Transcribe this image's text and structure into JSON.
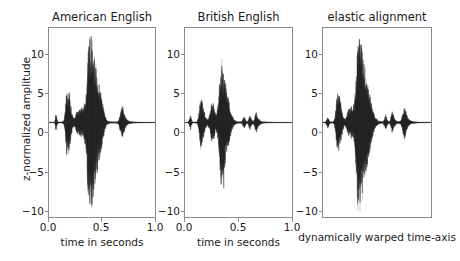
{
  "chart_data": {
    "type": "line",
    "title": "",
    "ylabel": "z-normalized amplitude",
    "ylim": [
      -12.5,
      12.5
    ],
    "yticks": [
      10,
      5,
      0,
      -5,
      -10
    ],
    "ytick_labels": [
      "10",
      "5",
      "0",
      "−5",
      "−10"
    ],
    "grid": false,
    "legend": null,
    "panels": [
      {
        "title": "American English",
        "xlabel": "time in seconds",
        "xlim": [
          0.0,
          1.0
        ],
        "xticks": [
          0.0,
          0.5,
          1.0
        ],
        "xtick_labels": [
          "0.0",
          "0.5",
          "1.0"
        ],
        "series_name": "waveform",
        "description": "speech waveform, z-normalized amplitude vs time in seconds",
        "envelope": [
          [
            0.0,
            0.05
          ],
          [
            0.04,
            0.06
          ],
          [
            0.055,
            0.1
          ],
          [
            0.062,
            0.85
          ],
          [
            0.068,
            1.3
          ],
          [
            0.075,
            0.55
          ],
          [
            0.082,
            0.12
          ],
          [
            0.1,
            0.08
          ],
          [
            0.12,
            0.1
          ],
          [
            0.14,
            0.25
          ],
          [
            0.15,
            1.2
          ],
          [
            0.158,
            2.6
          ],
          [
            0.165,
            4.4
          ],
          [
            0.172,
            4.2
          ],
          [
            0.18,
            3.2
          ],
          [
            0.19,
            4.1
          ],
          [
            0.2,
            3.0
          ],
          [
            0.21,
            2.0
          ],
          [
            0.22,
            1.1
          ],
          [
            0.232,
            0.55
          ],
          [
            0.245,
            0.7
          ],
          [
            0.258,
            1.35
          ],
          [
            0.268,
            1.7
          ],
          [
            0.278,
            1.4
          ],
          [
            0.288,
            1.9
          ],
          [
            0.298,
            1.6
          ],
          [
            0.308,
            2.1
          ],
          [
            0.318,
            1.7
          ],
          [
            0.328,
            2.3
          ],
          [
            0.338,
            2.8
          ],
          [
            0.348,
            3.3
          ],
          [
            0.356,
            5.2
          ],
          [
            0.362,
            7.6
          ],
          [
            0.368,
            9.5
          ],
          [
            0.374,
            10.9
          ],
          [
            0.38,
            9.8
          ],
          [
            0.386,
            11.3
          ],
          [
            0.392,
            10.2
          ],
          [
            0.398,
            11.6
          ],
          [
            0.404,
            10.6
          ],
          [
            0.41,
            11.4
          ],
          [
            0.416,
            10.0
          ],
          [
            0.422,
            9.2
          ],
          [
            0.43,
            8.6
          ],
          [
            0.438,
            8.0
          ],
          [
            0.446,
            7.4
          ],
          [
            0.454,
            6.8
          ],
          [
            0.462,
            6.2
          ],
          [
            0.47,
            5.6
          ],
          [
            0.478,
            5.0
          ],
          [
            0.486,
            4.4
          ],
          [
            0.494,
            3.8
          ],
          [
            0.502,
            3.1
          ],
          [
            0.51,
            2.4
          ],
          [
            0.518,
            1.8
          ],
          [
            0.526,
            1.2
          ],
          [
            0.534,
            0.7
          ],
          [
            0.545,
            0.35
          ],
          [
            0.56,
            0.2
          ],
          [
            0.58,
            0.14
          ],
          [
            0.6,
            0.12
          ],
          [
            0.62,
            0.1
          ],
          [
            0.64,
            0.12
          ],
          [
            0.655,
            0.25
          ],
          [
            0.665,
            0.7
          ],
          [
            0.675,
            1.3
          ],
          [
            0.685,
            1.9
          ],
          [
            0.692,
            2.2
          ],
          [
            0.7,
            1.9
          ],
          [
            0.708,
            1.4
          ],
          [
            0.716,
            0.95
          ],
          [
            0.726,
            0.6
          ],
          [
            0.74,
            0.35
          ],
          [
            0.76,
            0.2
          ],
          [
            0.79,
            0.12
          ],
          [
            0.83,
            0.08
          ],
          [
            0.88,
            0.06
          ],
          [
            0.94,
            0.05
          ],
          [
            1.0,
            0.04
          ]
        ],
        "lower_extra": [
          [
            0.374,
            -7.2
          ],
          [
            0.392,
            -6.0
          ],
          [
            0.41,
            -7.0
          ],
          [
            0.428,
            -5.6
          ]
        ]
      },
      {
        "title": "British English",
        "xlabel": "time in seconds",
        "xlim": [
          0.0,
          1.0
        ],
        "xticks": [
          0.0,
          0.5,
          1.0
        ],
        "xtick_labels": [
          "0.0",
          "0.5",
          "1.0"
        ],
        "series_name": "waveform",
        "description": "speech waveform, z-normalized amplitude vs time in seconds",
        "envelope": [
          [
            0.0,
            0.04
          ],
          [
            0.03,
            0.05
          ],
          [
            0.045,
            0.6
          ],
          [
            0.052,
            1.1
          ],
          [
            0.06,
            0.5
          ],
          [
            0.07,
            0.1
          ],
          [
            0.09,
            0.09
          ],
          [
            0.11,
            0.12
          ],
          [
            0.125,
            0.6
          ],
          [
            0.135,
            1.8
          ],
          [
            0.145,
            3.1
          ],
          [
            0.152,
            3.6
          ],
          [
            0.16,
            2.9
          ],
          [
            0.17,
            2.2
          ],
          [
            0.18,
            1.5
          ],
          [
            0.19,
            0.9
          ],
          [
            0.2,
            0.55
          ],
          [
            0.212,
            0.4
          ],
          [
            0.225,
            0.8
          ],
          [
            0.238,
            1.6
          ],
          [
            0.248,
            2.6
          ],
          [
            0.256,
            2.2
          ],
          [
            0.265,
            2.7
          ],
          [
            0.274,
            1.9
          ],
          [
            0.282,
            1.3
          ],
          [
            0.29,
            1.0
          ],
          [
            0.3,
            1.6
          ],
          [
            0.31,
            2.6
          ],
          [
            0.318,
            4.2
          ],
          [
            0.326,
            6.2
          ],
          [
            0.332,
            7.6
          ],
          [
            0.338,
            8.2
          ],
          [
            0.344,
            7.4
          ],
          [
            0.35,
            8.0
          ],
          [
            0.357,
            7.0
          ],
          [
            0.364,
            6.4
          ],
          [
            0.372,
            5.8
          ],
          [
            0.38,
            5.2
          ],
          [
            0.388,
            4.6
          ],
          [
            0.396,
            4.0
          ],
          [
            0.404,
            3.4
          ],
          [
            0.412,
            2.8
          ],
          [
            0.42,
            2.2
          ],
          [
            0.428,
            1.7
          ],
          [
            0.436,
            1.2
          ],
          [
            0.446,
            0.8
          ],
          [
            0.458,
            0.45
          ],
          [
            0.472,
            0.25
          ],
          [
            0.49,
            0.15
          ],
          [
            0.51,
            0.12
          ],
          [
            0.53,
            0.15
          ],
          [
            0.545,
            0.55
          ],
          [
            0.553,
            0.9
          ],
          [
            0.562,
            0.5
          ],
          [
            0.575,
            0.18
          ],
          [
            0.59,
            0.2
          ],
          [
            0.6,
            0.75
          ],
          [
            0.608,
            1.1
          ],
          [
            0.618,
            0.6
          ],
          [
            0.63,
            0.22
          ],
          [
            0.645,
            0.3
          ],
          [
            0.656,
            1.05
          ],
          [
            0.665,
            1.45
          ],
          [
            0.675,
            1.0
          ],
          [
            0.686,
            0.6
          ],
          [
            0.698,
            0.35
          ],
          [
            0.715,
            0.2
          ],
          [
            0.74,
            0.12
          ],
          [
            0.78,
            0.08
          ],
          [
            0.85,
            0.05
          ],
          [
            0.92,
            0.04
          ],
          [
            1.0,
            0.04
          ]
        ],
        "lower_extra": [
          [
            0.338,
            -9.6
          ],
          [
            0.35,
            -8.4
          ],
          [
            0.362,
            -9.0
          ]
        ]
      },
      {
        "title": "elastic alignment",
        "xlabel": "dynamically warped time-axis",
        "xlim": null,
        "xticks": [],
        "xtick_labels": [],
        "series_name": "waveform",
        "description": "speech waveform on dynamically warped time-axis, z-normalized amplitude",
        "envelope": [
          [
            0.0,
            0.05
          ],
          [
            0.02,
            0.06
          ],
          [
            0.035,
            0.4
          ],
          [
            0.045,
            0.9
          ],
          [
            0.055,
            0.4
          ],
          [
            0.07,
            0.1
          ],
          [
            0.09,
            0.1
          ],
          [
            0.105,
            0.3
          ],
          [
            0.115,
            1.4
          ],
          [
            0.125,
            3.0
          ],
          [
            0.133,
            4.3
          ],
          [
            0.14,
            3.6
          ],
          [
            0.15,
            3.9
          ],
          [
            0.16,
            3.0
          ],
          [
            0.17,
            2.2
          ],
          [
            0.18,
            1.4
          ],
          [
            0.192,
            0.7
          ],
          [
            0.205,
            0.5
          ],
          [
            0.218,
            0.85
          ],
          [
            0.23,
            1.5
          ],
          [
            0.242,
            2.0
          ],
          [
            0.252,
            1.6
          ],
          [
            0.262,
            2.2
          ],
          [
            0.272,
            1.8
          ],
          [
            0.282,
            2.4
          ],
          [
            0.292,
            3.2
          ],
          [
            0.3,
            4.6
          ],
          [
            0.308,
            6.6
          ],
          [
            0.314,
            8.8
          ],
          [
            0.32,
            10.6
          ],
          [
            0.326,
            11.6
          ],
          [
            0.332,
            10.4
          ],
          [
            0.338,
            11.7
          ],
          [
            0.344,
            10.8
          ],
          [
            0.35,
            11.2
          ],
          [
            0.357,
            10.2
          ],
          [
            0.364,
            9.4
          ],
          [
            0.372,
            8.7
          ],
          [
            0.38,
            8.0
          ],
          [
            0.388,
            7.3
          ],
          [
            0.397,
            6.6
          ],
          [
            0.406,
            5.9
          ],
          [
            0.415,
            5.2
          ],
          [
            0.424,
            4.5
          ],
          [
            0.433,
            3.8
          ],
          [
            0.442,
            3.1
          ],
          [
            0.452,
            2.4
          ],
          [
            0.462,
            1.8
          ],
          [
            0.472,
            1.25
          ],
          [
            0.484,
            0.8
          ],
          [
            0.498,
            0.45
          ],
          [
            0.515,
            0.25
          ],
          [
            0.535,
            0.16
          ],
          [
            0.555,
            0.14
          ],
          [
            0.57,
            0.55
          ],
          [
            0.58,
            1.1
          ],
          [
            0.59,
            0.55
          ],
          [
            0.605,
            0.2
          ],
          [
            0.62,
            0.25
          ],
          [
            0.632,
            0.95
          ],
          [
            0.642,
            1.5
          ],
          [
            0.652,
            1.0
          ],
          [
            0.665,
            0.5
          ],
          [
            0.68,
            0.22
          ],
          [
            0.7,
            0.16
          ],
          [
            0.72,
            0.25
          ],
          [
            0.735,
            1.0
          ],
          [
            0.745,
            1.9
          ],
          [
            0.755,
            2.3
          ],
          [
            0.765,
            1.8
          ],
          [
            0.775,
            1.1
          ],
          [
            0.788,
            0.6
          ],
          [
            0.805,
            0.3
          ],
          [
            0.83,
            0.16
          ],
          [
            0.865,
            0.1
          ],
          [
            0.91,
            0.07
          ],
          [
            0.96,
            0.05
          ],
          [
            1.0,
            0.04
          ]
        ],
        "lower_extra": [
          [
            0.32,
            -9.8
          ],
          [
            0.338,
            -8.6
          ],
          [
            0.352,
            -9.2
          ],
          [
            0.368,
            -7.4
          ]
        ]
      }
    ]
  },
  "axes": {
    "ylabel": "z-normalized amplitude",
    "ytick_labels": [
      "10",
      "5",
      "0",
      "−5",
      "−10"
    ],
    "xtick_labels_shared": [
      "0.0",
      "0.5",
      "1.0"
    ]
  },
  "style": {
    "wave_color": "#262626",
    "axis_color": "#8a8a8a",
    "text_color": "#1a1a1a",
    "background": "#ffffff"
  }
}
